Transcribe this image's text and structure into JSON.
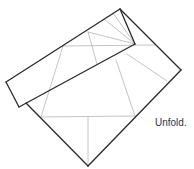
{
  "diagram": {
    "caption": "Unfold.",
    "colors": {
      "edge": "#2a2a2a",
      "crease": "#b5b5b5"
    },
    "edges": [
      {
        "name": "square-top-right-edge",
        "x1": 120,
        "y1": 9,
        "x2": 181,
        "y2": 70
      },
      {
        "name": "square-bottom-right-edge",
        "x1": 181,
        "y1": 70,
        "x2": 88,
        "y2": 166
      },
      {
        "name": "square-bottom-left-edge",
        "x1": 88,
        "y1": 166,
        "x2": 26,
        "y2": 103
      },
      {
        "name": "flap-top-edge",
        "x1": 6,
        "y1": 82,
        "x2": 120,
        "y2": 9
      },
      {
        "name": "flap-right-edge",
        "x1": 120,
        "y1": 9,
        "x2": 135,
        "y2": 44
      },
      {
        "name": "flap-bottom-edge",
        "x1": 135,
        "y1": 44,
        "x2": 19,
        "y2": 107
      },
      {
        "name": "flap-left-edge",
        "x1": 6,
        "y1": 82,
        "x2": 19,
        "y2": 107
      }
    ],
    "creases": [
      {
        "name": "upper-horizontal-crease",
        "x1": 63,
        "y1": 46,
        "x2": 155,
        "y2": 45
      },
      {
        "name": "lower-horizontal-crease",
        "x1": 41,
        "y1": 117,
        "x2": 135,
        "y2": 116
      },
      {
        "name": "center-vertical-crease",
        "x1": 88,
        "y1": 117,
        "x2": 88,
        "y2": 166
      },
      {
        "name": "left-diagonal-crease",
        "x1": 63,
        "y1": 46,
        "x2": 41,
        "y2": 117
      },
      {
        "name": "right-diagonal-crease",
        "x1": 116,
        "y1": 60,
        "x2": 135,
        "y2": 116
      },
      {
        "name": "inner-vertical-crease",
        "x1": 88,
        "y1": 32,
        "x2": 97,
        "y2": 64
      },
      {
        "name": "radiating-crease-1",
        "x1": 88,
        "y1": 32,
        "x2": 135,
        "y2": 44
      },
      {
        "name": "radiating-crease-2",
        "x1": 104,
        "y1": 19,
        "x2": 135,
        "y2": 44
      },
      {
        "name": "radiating-crease-3",
        "x1": 113,
        "y1": 13,
        "x2": 135,
        "y2": 44
      },
      {
        "name": "right-lower-crease",
        "x1": 127,
        "y1": 54,
        "x2": 167,
        "y2": 81
      }
    ]
  }
}
